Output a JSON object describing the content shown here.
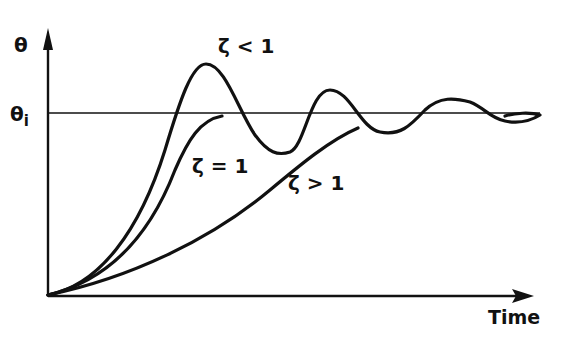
{
  "diagram": {
    "type": "step-response",
    "y_axis_label": "θ",
    "reference_label": "θ",
    "reference_subscript": "i",
    "x_axis_label": "Time",
    "curves": [
      {
        "name": "underdamped",
        "label_symbol": "ζ",
        "label_rel": "<",
        "label_val": "1"
      },
      {
        "name": "critically-damped",
        "label_symbol": "ζ",
        "label_rel": "=",
        "label_val": "1"
      },
      {
        "name": "overdamped",
        "label_symbol": "ζ",
        "label_rel": ">",
        "label_val": "1"
      }
    ]
  },
  "labels": {
    "underdamped": "ζ < 1",
    "critical": "ζ = 1",
    "overdamped": "ζ > 1"
  }
}
